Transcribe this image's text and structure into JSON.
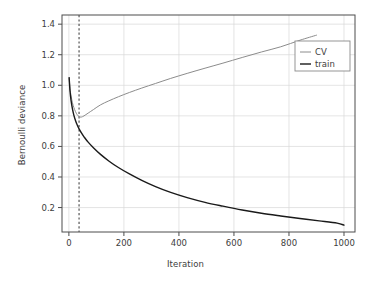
{
  "chart_data": {
    "type": "line",
    "title": "",
    "xlabel": "Iteration",
    "ylabel": "Bernoulli deviance",
    "xlim": [
      -25,
      1040
    ],
    "ylim": [
      0.04,
      1.46
    ],
    "xticks": [
      0,
      200,
      400,
      600,
      800,
      1000
    ],
    "xtick_labels": [
      "0",
      "200",
      "400",
      "600",
      "800",
      "1000"
    ],
    "yticks": [
      0.2,
      0.4,
      0.6,
      0.8,
      1.0,
      1.2,
      1.4
    ],
    "ytick_labels": [
      "0.2",
      "0.4",
      "0.6",
      "0.8",
      "1.0",
      "1.2",
      "1.4"
    ],
    "grid": true,
    "grid_color": "#d9d9d9",
    "legend_position": "upper right",
    "legend_entries": [
      "CV",
      "train"
    ],
    "annotations": [
      {
        "type": "vertical-dashed-line",
        "name": "optimal-iteration-marker",
        "x": 37,
        "color": "#555555",
        "style": "dashed"
      }
    ],
    "series": [
      {
        "name": "CV",
        "color": "#8c8c8c",
        "linewidth": 1.0,
        "x": [
          1,
          4,
          8,
          13,
          18,
          24,
          30,
          37,
          45,
          55,
          70,
          90,
          115,
          145,
          180,
          220,
          265,
          315,
          370,
          430,
          495,
          560,
          630,
          700,
          770,
          840,
          900
        ],
        "y": [
          1.05,
          0.98,
          0.93,
          0.885,
          0.855,
          0.828,
          0.808,
          0.795,
          0.792,
          0.8,
          0.818,
          0.842,
          0.872,
          0.898,
          0.925,
          0.953,
          0.982,
          1.012,
          1.045,
          1.078,
          1.112,
          1.145,
          1.182,
          1.218,
          1.252,
          1.295,
          1.328
        ]
      },
      {
        "name": "train",
        "color": "#1a1a1a",
        "linewidth": 1.4,
        "x": [
          1,
          4,
          8,
          13,
          18,
          24,
          30,
          37,
          45,
          55,
          70,
          90,
          115,
          145,
          180,
          220,
          265,
          315,
          370,
          430,
          495,
          560,
          630,
          700,
          770,
          840,
          910,
          975,
          1000
        ],
        "y": [
          1.05,
          0.965,
          0.9,
          0.845,
          0.805,
          0.77,
          0.742,
          0.715,
          0.69,
          0.663,
          0.628,
          0.59,
          0.548,
          0.505,
          0.462,
          0.42,
          0.378,
          0.337,
          0.299,
          0.265,
          0.234,
          0.209,
          0.184,
          0.163,
          0.145,
          0.128,
          0.113,
          0.098,
          0.085
        ]
      }
    ]
  },
  "figure": {
    "background_color": "#ffffff",
    "axis_color": "#4d4d4d",
    "text_color": "#3d3d3d"
  }
}
